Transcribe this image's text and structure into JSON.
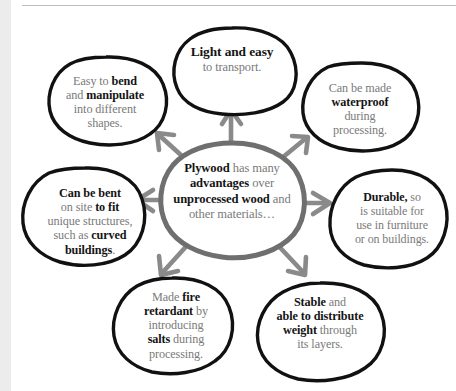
{
  "page": {
    "title": "Plywood has many advantages over unprocessed wood and other materials",
    "background_color": "#ffffff",
    "left_margin_band_color": "#ececec",
    "rule_color": "#bfbfbf"
  },
  "style": {
    "bubble_stroke": "#111111",
    "arrow_color": "#8a8a8a",
    "center_stroke": "#6f6f6f",
    "bold_text_color": "#141414",
    "regular_text_color": "#7a7a7a"
  },
  "diagram": {
    "type": "radial-spoke",
    "center": {
      "name": "center-bubble",
      "text_html": "<b>Plywood</b> has many <b>advantages</b> over <b>unprocessed wood</b> and other materials…",
      "text_plain": "Plywood has many advantages over unprocessed wood and other materials…"
    },
    "spokes": 8,
    "nodes": [
      {
        "id": "light-and-easy",
        "position": "top",
        "text_html": "<b>Light and easy</b><br>to transport.",
        "text_plain": "Light and easy to transport."
      },
      {
        "id": "easy-to-bend",
        "position": "top-left",
        "text_html": "Easy to <b>bend</b><br>and <b>manipulate</b><br>into different<br>shapes.",
        "text_plain": "Easy to bend and manipulate into different shapes."
      },
      {
        "id": "waterproof",
        "position": "top-right",
        "text_html": "Can be made<br><b>waterproof</b><br>during<br>processing.",
        "text_plain": "Can be made waterproof during processing."
      },
      {
        "id": "can-be-bent",
        "position": "left",
        "text_html": "<b>Can be bent</b><br>on site <b>to fit</b><br>unique structures,<br>such as <b>curved<br>buildings</b>.",
        "text_plain": "Can be bent on site to fit unique structures, such as curved buildings."
      },
      {
        "id": "durable",
        "position": "right",
        "text_html": "<b>Durable,</b> so<br>is suitable for<br>use in furniture<br>or on buildings.",
        "text_plain": "Durable, so is suitable for use in furniture or on buildings."
      },
      {
        "id": "fire-retardant",
        "position": "bottom-left",
        "text_html": "Made <b>fire<br>retardant</b> by<br>introducing<br><b>salts</b> during<br>processing.",
        "text_plain": "Made fire retardant by introducing salts during processing."
      },
      {
        "id": "stable",
        "position": "bottom-right",
        "text_html": "<b>Stable</b> and<br><b>able to distribute<br>weight</b> through<br>its layers.",
        "text_plain": "Stable and able to distribute weight through its layers."
      }
    ]
  }
}
